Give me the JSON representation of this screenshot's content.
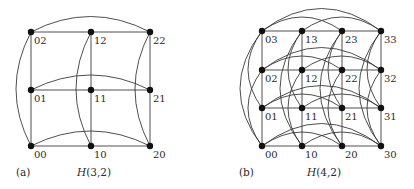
{
  "figure": {
    "panels": [
      {
        "id": "a",
        "caption_letter": "(a)",
        "title_italic": "H",
        "title_rest": "(3,2)",
        "nodes": [
          {
            "label": "00"
          },
          {
            "label": "10"
          },
          {
            "label": "20"
          },
          {
            "label": "01"
          },
          {
            "label": "11"
          },
          {
            "label": "21"
          },
          {
            "label": "02"
          },
          {
            "label": "12"
          },
          {
            "label": "22"
          }
        ]
      },
      {
        "id": "b",
        "caption_letter": "(b)",
        "title_italic": "H",
        "title_rest": "(4,2)",
        "nodes": [
          {
            "label": "00"
          },
          {
            "label": "10"
          },
          {
            "label": "20"
          },
          {
            "label": "30"
          },
          {
            "label": "01"
          },
          {
            "label": "11"
          },
          {
            "label": "21"
          },
          {
            "label": "31"
          },
          {
            "label": "02"
          },
          {
            "label": "12"
          },
          {
            "label": "22"
          },
          {
            "label": "32"
          },
          {
            "label": "03"
          },
          {
            "label": "13"
          },
          {
            "label": "23"
          },
          {
            "label": "33"
          }
        ]
      }
    ]
  }
}
